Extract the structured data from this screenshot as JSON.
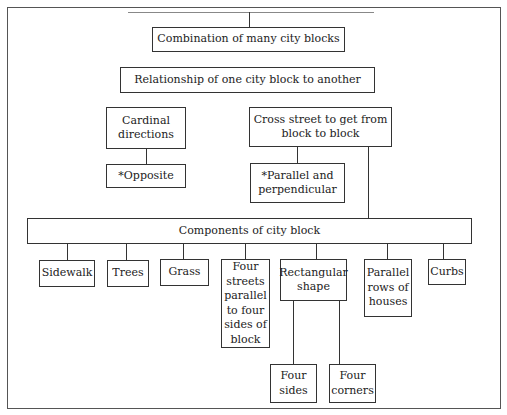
{
  "diagram": {
    "type": "hierarchy",
    "nodes": {
      "combination": "Combination of many city blocks",
      "relationship": "Relationship of one city block to another",
      "cardinal": "Cardinal directions",
      "opposite": "*Opposite",
      "cross_street": "Cross street to get from block to block",
      "parallel_perp": "*Parallel and perpendicular",
      "components": "Components of city block",
      "sidewalk": "Sidewalk",
      "trees": "Trees",
      "grass": "Grass",
      "four_streets": "Four streets parallel to four sides of block",
      "rectangular": "Rectangular shape",
      "parallel_rows": "Parallel rows of houses",
      "curbs": "Curbs",
      "four_sides": "Four sides",
      "four_corners": "Four corners"
    },
    "edges": [
      [
        "cardinal",
        "opposite"
      ],
      [
        "cross_street",
        "parallel_perp"
      ],
      [
        "cross_street",
        "components"
      ],
      [
        "components",
        "sidewalk"
      ],
      [
        "components",
        "trees"
      ],
      [
        "components",
        "grass"
      ],
      [
        "components",
        "four_streets"
      ],
      [
        "components",
        "rectangular"
      ],
      [
        "components",
        "parallel_rows"
      ],
      [
        "components",
        "curbs"
      ],
      [
        "rectangular",
        "four_sides"
      ],
      [
        "rectangular",
        "four_corners"
      ]
    ]
  }
}
